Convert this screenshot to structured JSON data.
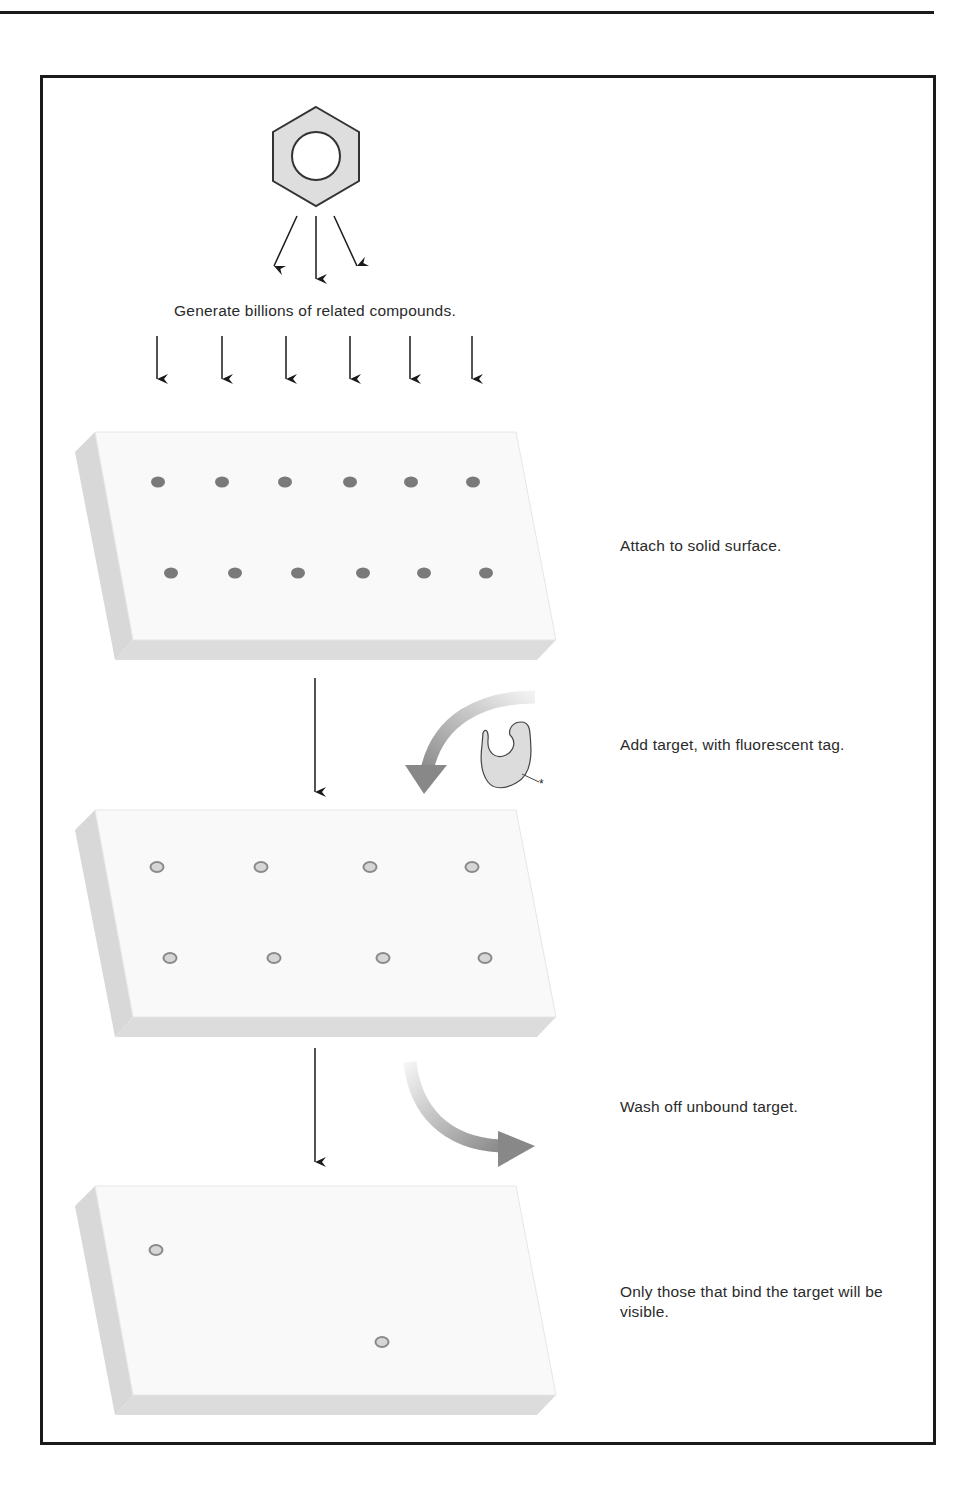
{
  "figure": {
    "steps": [
      {
        "id": "generate",
        "label": "Generate billions of related compounds."
      },
      {
        "id": "attach",
        "label": "Attach to solid surface."
      },
      {
        "id": "add-target",
        "label": "Add target, with fluorescent tag."
      },
      {
        "id": "wash",
        "label": "Wash off unbound target."
      },
      {
        "id": "visible",
        "label": "Only those that bind the target will be visible."
      }
    ],
    "tag_symbol": "*",
    "colors": {
      "slab_top": "#f9f9f9",
      "slab_side": "#d9d9d9",
      "compound_dot": "#7a7a7a",
      "bound_ring": "#8a8a8a",
      "bound_fill": "#d6d6d6",
      "target_fill": "#dcdcdc",
      "arrow_gray": "#8c8c8c",
      "frame": "#1a1a1a"
    },
    "slabs": [
      {
        "name": "slab-compounds",
        "row1_count": 6,
        "row2_count": 6
      },
      {
        "name": "slab-target-added",
        "row1_count": 4,
        "row2_count": 4
      },
      {
        "name": "slab-washed",
        "bound_count": 2
      }
    ]
  }
}
